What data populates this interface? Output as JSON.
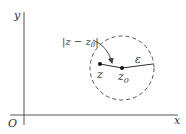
{
  "figure": {
    "axes": {
      "x_label": "x",
      "y_label": "y",
      "origin_label": "O"
    },
    "disk": {
      "center_label": "z",
      "center_subscript": "0",
      "radius_label": "ε",
      "boundary_style": "dashed"
    },
    "point": {
      "label": "z"
    },
    "distance_annotation": {
      "open_bar": "|",
      "z": "z",
      "minus": " − ",
      "z0": "z",
      "subscript": "0",
      "close_bar": "|"
    }
  },
  "colors": {
    "line": "#444444",
    "text": "#333333",
    "background": "#ffffff"
  }
}
